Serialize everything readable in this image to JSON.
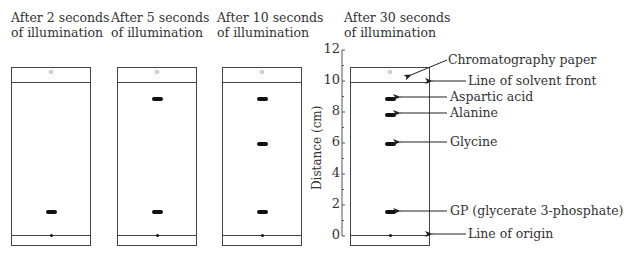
{
  "panels": [
    {
      "title_line1": "After 2 seconds",
      "title_line2": "of illumination"
    },
    {
      "title_line1": "After 5 seconds",
      "title_line2": "of illumination"
    },
    {
      "title_line1": "After 10 seconds",
      "title_line2": "of illumination"
    },
    {
      "title_line1": "After 30 seconds",
      "title_line2": "of illumination"
    }
  ],
  "axis": {
    "label": "Distance (cm)",
    "ticks": [
      "12",
      "10",
      "8",
      "6",
      "4",
      "2",
      "0"
    ]
  },
  "annotations": {
    "paper": "Chromatography paper",
    "solvent_front": "Line of solvent front",
    "aspartic": "Aspartic acid",
    "alanine": "Alanine",
    "glycine": "Glycine",
    "gp": "GP (glycerate 3-phosphate)",
    "origin": "Line of origin"
  },
  "spot_distances_cm": {
    "after_2s": [
      1.5
    ],
    "after_5s": [
      1.5,
      9
    ],
    "after_10s": [
      1.5,
      6,
      9
    ],
    "after_30s": [
      1.5,
      6,
      8,
      9
    ]
  }
}
